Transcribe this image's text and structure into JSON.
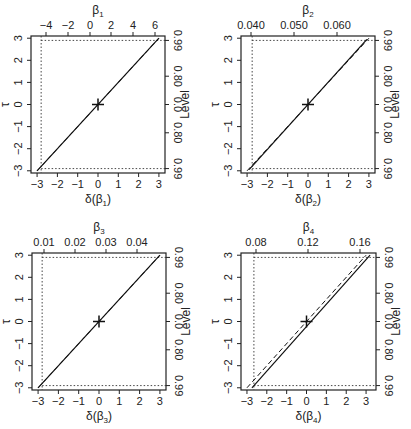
{
  "chart_data": [
    {
      "type": "line",
      "panel": 1,
      "xlabel": "δ(β1)",
      "ylabel": "τ",
      "top_label": "β1",
      "right_label": "Level",
      "xlim": [
        -3.3,
        3.3
      ],
      "ylim": [
        -3.1,
        3.1
      ],
      "x_ticks": [
        -3,
        -2,
        -1,
        0,
        1,
        2,
        3
      ],
      "y_ticks": [
        -3,
        -2,
        -1,
        0,
        1,
        2,
        3
      ],
      "top_ticks": [
        "-4",
        "-2",
        "0",
        "2",
        "4",
        "6"
      ],
      "right_ticks": [
        "0.99",
        "0.80",
        "0.0",
        "0.80",
        "0.99"
      ],
      "series": [
        {
          "name": "profile τ (solid)",
          "x": [
            -3.0,
            3.0
          ],
          "y": [
            -3.0,
            3.0
          ]
        },
        {
          "name": "linear reference (dashed)",
          "x": [
            -3.0,
            3.0
          ],
          "y": [
            -3.0,
            3.0
          ]
        }
      ],
      "estimate_marker": {
        "x": 0,
        "y": 0,
        "symbol": "+"
      },
      "dotted_vertical_x": -2.8,
      "dotted_horizontal_y": [
        -2.9,
        2.9
      ],
      "grid": false
    },
    {
      "type": "line",
      "panel": 2,
      "xlabel": "δ(β2)",
      "ylabel": "τ",
      "top_label": "β2",
      "right_label": "Level",
      "xlim": [
        -3.3,
        3.3
      ],
      "ylim": [
        -3.1,
        3.1
      ],
      "x_ticks": [
        -3,
        -2,
        -1,
        0,
        1,
        2,
        3
      ],
      "y_ticks": [
        -3,
        -2,
        -1,
        0,
        1,
        2,
        3
      ],
      "top_ticks": [
        "0.040",
        "0.050",
        "0.060"
      ],
      "right_ticks": [
        "0.99",
        "0.80",
        "0.0",
        "0.80",
        "0.99"
      ],
      "series": [
        {
          "name": "profile τ (solid)",
          "x": [
            -2.9,
            2.9
          ],
          "y": [
            -2.95,
            2.95
          ]
        },
        {
          "name": "linear reference (dashed)",
          "x": [
            -3.0,
            3.0
          ],
          "y": [
            -3.0,
            3.0
          ]
        }
      ],
      "estimate_marker": {
        "x": 0,
        "y": 0,
        "symbol": "+"
      },
      "dotted_vertical_x": -2.75,
      "dotted_horizontal_y": [
        -2.9,
        2.9
      ],
      "grid": false
    },
    {
      "type": "line",
      "panel": 3,
      "xlabel": "δ(β3)",
      "ylabel": "τ",
      "top_label": "β3",
      "right_label": "Level",
      "xlim": [
        -3.3,
        3.3
      ],
      "ylim": [
        -3.1,
        3.1
      ],
      "x_ticks": [
        -3,
        -2,
        -1,
        0,
        1,
        2,
        3
      ],
      "y_ticks": [
        -3,
        -2,
        -1,
        0,
        1,
        2,
        3
      ],
      "top_ticks": [
        "0.01",
        "0.02",
        "0.03",
        "0.04"
      ],
      "right_ticks": [
        "0.99",
        "0.80",
        "0.0",
        "0.80",
        "0.99"
      ],
      "series": [
        {
          "name": "profile τ (solid)",
          "x": [
            -3.0,
            3.0
          ],
          "y": [
            -3.0,
            3.0
          ]
        },
        {
          "name": "linear reference (dashed)",
          "x": [
            -3.0,
            3.0
          ],
          "y": [
            -3.0,
            3.0
          ]
        }
      ],
      "estimate_marker": {
        "x": 0,
        "y": 0,
        "symbol": "+"
      },
      "dotted_vertical_x": -2.8,
      "dotted_horizontal_y": [
        -2.9,
        2.9
      ],
      "grid": false
    },
    {
      "type": "line",
      "panel": 4,
      "xlabel": "δ(β4)",
      "ylabel": "τ",
      "top_label": "β4",
      "right_label": "Level",
      "xlim": [
        -3.3,
        3.5
      ],
      "ylim": [
        -3.1,
        3.1
      ],
      "x_ticks": [
        -3,
        -2,
        -1,
        0,
        1,
        2,
        3
      ],
      "y_ticks": [
        -3,
        -2,
        -1,
        0,
        1,
        2,
        3
      ],
      "top_ticks": [
        "0.08",
        "0.12",
        "0.16"
      ],
      "right_ticks": [
        "0.99",
        "0.80",
        "0.0",
        "0.80",
        "0.99"
      ],
      "series": [
        {
          "name": "profile τ (solid)",
          "x": [
            -2.75,
            3.2
          ],
          "y": [
            -3.0,
            3.0
          ]
        },
        {
          "name": "linear reference (dashed)",
          "x": [
            -3.0,
            3.0
          ],
          "y": [
            -3.0,
            3.0
          ]
        }
      ],
      "estimate_marker": {
        "x": 0,
        "y": 0,
        "symbol": "+"
      },
      "dotted_vertical_x": -2.65,
      "dotted_horizontal_y": [
        -2.9,
        2.9
      ],
      "grid": false
    }
  ],
  "panels": [
    {
      "top_label_base": "β",
      "top_label_sub": "1",
      "x_label_pre": "δ(β",
      "x_label_sub": "1",
      "x_label_post": ")",
      "y_label": "τ",
      "right_label": "Level"
    },
    {
      "top_label_base": "β",
      "top_label_sub": "2",
      "x_label_pre": "δ(β",
      "x_label_sub": "2",
      "x_label_post": ")",
      "y_label": "τ",
      "right_label": "Level"
    },
    {
      "top_label_base": "β",
      "top_label_sub": "3",
      "x_label_pre": "δ(β",
      "x_label_sub": "3",
      "x_label_post": ")",
      "y_label": "τ",
      "right_label": "Level"
    },
    {
      "top_label_base": "β",
      "top_label_sub": "4",
      "x_label_pre": "δ(β",
      "x_label_sub": "4",
      "x_label_post": ")",
      "y_label": "τ",
      "right_label": "Level"
    }
  ],
  "tick_text": {
    "x": [
      "−3",
      "−2",
      "−1",
      "0",
      "1",
      "2",
      "3"
    ],
    "y": [
      "−3",
      "−2",
      "−1",
      "0",
      "1",
      "2",
      "3"
    ],
    "right": [
      "0.99",
      "0.80",
      "0.0",
      "0.80",
      "0.99"
    ]
  },
  "top_tick_text": [
    [
      "−4",
      "−2",
      "0",
      "2",
      "4",
      "6"
    ],
    [
      "0.040",
      "0.050",
      "0.060"
    ],
    [
      "0.01",
      "0.02",
      "0.03",
      "0.04"
    ],
    [
      "0.08",
      "0.12",
      "0.16"
    ]
  ]
}
